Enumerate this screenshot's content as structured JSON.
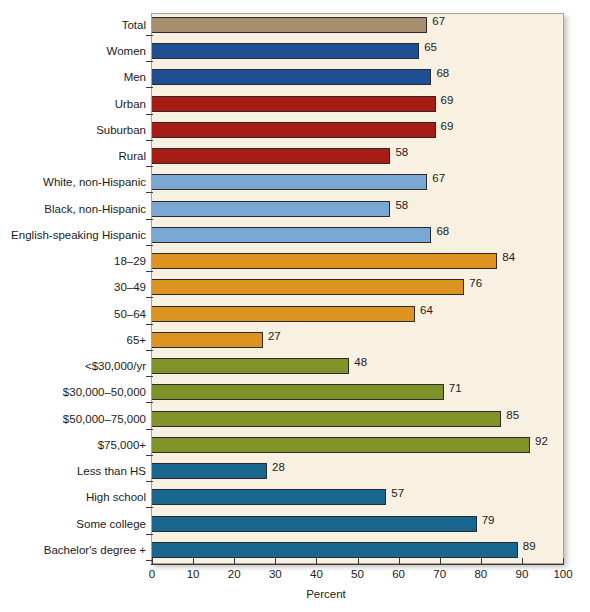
{
  "chart_data": {
    "type": "bar",
    "orientation": "horizontal",
    "title": "",
    "xlabel": "Percent",
    "ylabel": "",
    "xlim": [
      0,
      100
    ],
    "xticks": [
      0,
      10,
      20,
      30,
      40,
      50,
      60,
      70,
      80,
      90,
      100
    ],
    "grid": false,
    "legend": "none",
    "value_labels": true,
    "categories": [
      "Total",
      "Women",
      "Men",
      "Urban",
      "Suburban",
      "Rural",
      "White, non-Hispanic",
      "Black, non-Hispanic",
      "English-speaking Hispanic",
      "18–29",
      "30–49",
      "50–64",
      "65+",
      "<$30,000/yr",
      "$30,000–50,000",
      "$50,000–75,000",
      "$75,000+",
      "Less than HS",
      "High school",
      "Some college",
      "Bachelor's degree +"
    ],
    "values": [
      67,
      65,
      68,
      69,
      69,
      58,
      67,
      58,
      68,
      84,
      76,
      64,
      27,
      48,
      71,
      85,
      92,
      28,
      57,
      79,
      89
    ],
    "bar_colors": [
      "#a78e6f",
      "#1f4f93",
      "#1f4f93",
      "#a81c16",
      "#a81c16",
      "#a81c16",
      "#7aa7d4",
      "#7aa7d4",
      "#7aa7d4",
      "#dd9321",
      "#dd9321",
      "#dd9321",
      "#dd9321",
      "#7f9328",
      "#7f9328",
      "#7f9328",
      "#7f9328",
      "#19668f",
      "#19668f",
      "#19668f",
      "#19668f"
    ],
    "groups": [
      {
        "name": "Total",
        "color": "#a78e6f",
        "categories": [
          "Total"
        ]
      },
      {
        "name": "Gender",
        "color": "#1f4f93",
        "categories": [
          "Women",
          "Men"
        ]
      },
      {
        "name": "Community type",
        "color": "#a81c16",
        "categories": [
          "Urban",
          "Suburban",
          "Rural"
        ]
      },
      {
        "name": "Race/ethnicity",
        "color": "#7aa7d4",
        "categories": [
          "White, non-Hispanic",
          "Black, non-Hispanic",
          "English-speaking Hispanic"
        ]
      },
      {
        "name": "Age",
        "color": "#dd9321",
        "categories": [
          "18–29",
          "30–49",
          "50–64",
          "65+"
        ]
      },
      {
        "name": "Household income",
        "color": "#7f9328",
        "categories": [
          "<$30,000/yr",
          "$30,000–50,000",
          "$50,000–75,000",
          "$75,000+"
        ]
      },
      {
        "name": "Education",
        "color": "#19668f",
        "categories": [
          "Less than HS",
          "High school",
          "Some college",
          "Bachelor's degree +"
        ]
      }
    ],
    "panel_background": "#f8f0e1",
    "bar_outline_color": "#2b2b2b",
    "text_color": "#1b1b1b"
  }
}
